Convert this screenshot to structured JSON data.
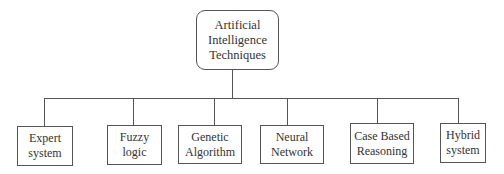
{
  "diagram": {
    "type": "hierarchy-tree",
    "root": {
      "label_lines": [
        "Artificial",
        "Intelligence",
        "Techniques"
      ]
    },
    "children": [
      {
        "label_lines": [
          "Expert",
          "system"
        ]
      },
      {
        "label_lines": [
          "Fuzzy",
          "logic"
        ]
      },
      {
        "label_lines": [
          "Genetic",
          "Algorithm"
        ]
      },
      {
        "label_lines": [
          "Neural",
          "Network"
        ]
      },
      {
        "label_lines": [
          "Case Based",
          "Reasoning"
        ]
      },
      {
        "label_lines": [
          "Hybrid",
          "system"
        ]
      }
    ],
    "colors": {
      "line": "#555555",
      "text": "#333333",
      "background": "#ffffff"
    }
  }
}
